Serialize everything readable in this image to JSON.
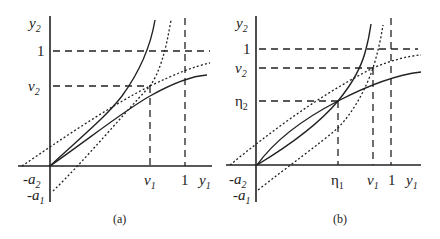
{
  "figure": {
    "panels": [
      {
        "id": "a",
        "caption": "(a)",
        "axis_labels": {
          "y": "y",
          "y_sub": "2",
          "x": "y",
          "x_sub": "1"
        },
        "y_ticks": [
          {
            "label": "1",
            "sub": ""
          },
          {
            "label": "v",
            "sub": "2"
          }
        ],
        "x_ticks": [
          {
            "label": "v",
            "sub": "1"
          },
          {
            "label": "1",
            "sub": ""
          }
        ],
        "neg_labels": [
          {
            "label": "-a",
            "sub": "2"
          },
          {
            "label": "-a",
            "sub": "1"
          }
        ]
      },
      {
        "id": "b",
        "caption": "(b)",
        "axis_labels": {
          "y": "y",
          "y_sub": "2",
          "x": "y",
          "x_sub": "1"
        },
        "y_ticks": [
          {
            "label": "1",
            "sub": ""
          },
          {
            "label": "v",
            "sub": "2"
          },
          {
            "label": "η",
            "sub": "2"
          }
        ],
        "x_ticks": [
          {
            "label": "η",
            "sub": "1"
          },
          {
            "label": "v",
            "sub": "1"
          },
          {
            "label": "1",
            "sub": ""
          }
        ],
        "neg_labels": [
          {
            "label": "-a",
            "sub": "2"
          },
          {
            "label": "-a",
            "sub": "1"
          }
        ]
      }
    ]
  }
}
